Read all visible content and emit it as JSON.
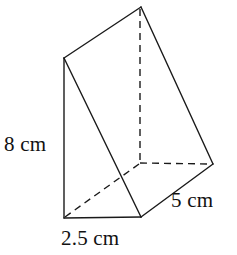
{
  "figure": {
    "name": "triangular-prism-diagram",
    "background_color": "#ffffff",
    "stroke_color": "#1a1a1a",
    "stroke_width": 1.4,
    "hidden_edge_dash": "7,5"
  },
  "labels": {
    "height": "8 cm",
    "depth": "5 cm",
    "width": "2.5 cm"
  },
  "geometry": {
    "vertices": {
      "apex_top": [
        141,
        7
      ],
      "left_top": [
        64,
        58
      ],
      "left_bottom": [
        64,
        218
      ],
      "front_bottom": [
        141,
        217
      ],
      "right": [
        213,
        164
      ],
      "hidden_back": [
        140,
        163
      ]
    },
    "visible_edges": [
      [
        "left_top",
        "apex_top"
      ],
      [
        "apex_top",
        "right"
      ],
      [
        "left_top",
        "left_bottom"
      ],
      [
        "left_top",
        "front_bottom"
      ],
      [
        "left_bottom",
        "front_bottom"
      ],
      [
        "front_bottom",
        "right"
      ]
    ],
    "hidden_edges": [
      [
        "apex_top",
        "hidden_back"
      ],
      [
        "hidden_back",
        "right"
      ],
      [
        "hidden_back",
        "left_bottom"
      ]
    ]
  }
}
